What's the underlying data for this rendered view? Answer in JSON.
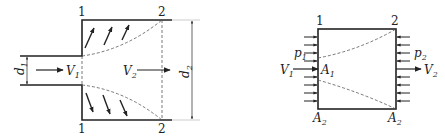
{
  "colors": {
    "stroke": "#222222",
    "dashed": "#555555",
    "background": "#ffffff"
  },
  "left_diagram": {
    "title": "sudden expansion pipe",
    "section_labels": {
      "top_1": "1",
      "top_2": "2",
      "bottom_1": "1",
      "bottom_2": "2"
    },
    "inlet_diameter": {
      "symbol": "d",
      "sub": "1"
    },
    "outlet_diameter": {
      "symbol": "d",
      "sub": "2"
    },
    "inlet_velocity": {
      "symbol": "V",
      "sub": "1"
    },
    "outlet_velocity": {
      "symbol": "V",
      "sub": "2"
    }
  },
  "right_diagram": {
    "title": "control volume",
    "section_labels": {
      "top_1": "1",
      "top_2": "2"
    },
    "inlet_pressure": {
      "symbol": "p",
      "sub": "1"
    },
    "outlet_pressure": {
      "symbol": "p",
      "sub": "2"
    },
    "inlet_velocity": {
      "symbol": "V",
      "sub": "1"
    },
    "outlet_velocity": {
      "symbol": "V",
      "sub": "2"
    },
    "inlet_area": {
      "symbol": "A",
      "sub": "1"
    },
    "area_bottom_left": {
      "symbol": "A",
      "sub": "2"
    },
    "area_bottom_right": {
      "symbol": "A",
      "sub": "2"
    }
  }
}
